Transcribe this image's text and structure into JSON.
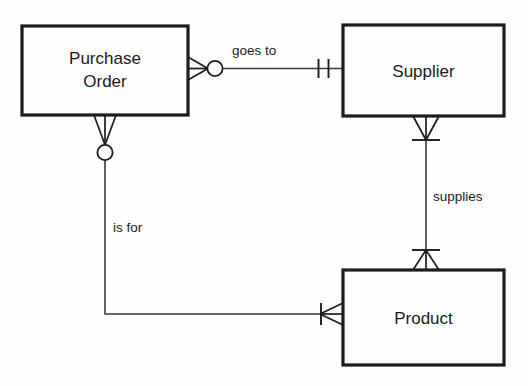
{
  "diagram": {
    "kind": "entity-relationship-diagram",
    "notation": "crow's foot",
    "background_color": "#fefefe",
    "line_color": "#1c1c1c",
    "text_color": "#1a1a1a",
    "entities": [
      {
        "id": "purchase-order",
        "label_line1": "Purchase",
        "label_line2": "Order",
        "x": 22,
        "y": 26,
        "width": 166,
        "height": 89
      },
      {
        "id": "supplier",
        "label_line1": "Supplier",
        "label_line2": "",
        "x": 343,
        "y": 25,
        "width": 161,
        "height": 91
      },
      {
        "id": "product",
        "label_line1": "Product",
        "label_line2": "",
        "x": 343,
        "y": 270,
        "width": 161,
        "height": 95
      }
    ],
    "relationships": [
      {
        "id": "goes-to",
        "label": "goes to",
        "from": "purchase-order",
        "to": "supplier",
        "from_cardinality": "zero-or-many",
        "to_cardinality": "exactly-one",
        "label_x": 232,
        "label_y": 55
      },
      {
        "id": "supplies",
        "label": "supplies",
        "from": "supplier",
        "to": "product",
        "from_cardinality": "one-or-many",
        "to_cardinality": "one-or-many",
        "label_x": 433,
        "label_y": 201
      },
      {
        "id": "is-for",
        "label": "is for",
        "from": "purchase-order",
        "to": "product",
        "from_cardinality": "zero-or-many",
        "to_cardinality": "many",
        "label_x": 113,
        "label_y": 232
      }
    ]
  }
}
